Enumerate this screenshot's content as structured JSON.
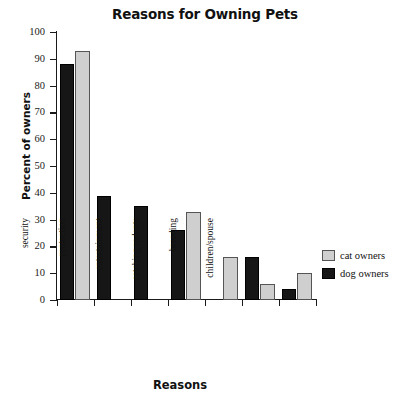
{
  "chart_data": {
    "type": "bar",
    "title": "Reasons for Owning Pets",
    "xlabel": "Reasons",
    "ylabel": "Percent of owners",
    "ylim": [
      0,
      100
    ],
    "ytick_step": 10,
    "yticks": [
      0,
      10,
      20,
      30,
      40,
      50,
      60,
      70,
      80,
      90,
      100
    ],
    "grid": false,
    "legend_position": "right",
    "categories": [
      "love/comp.",
      "security",
      "protection",
      "entertainment",
      "catching rodents",
      "breeding",
      "children/spouse"
    ],
    "series": [
      {
        "name": "dog owners",
        "color": "#161616",
        "values": [
          88,
          39,
          35,
          26,
          0,
          16,
          4
        ]
      },
      {
        "name": "cat owners",
        "color": "#cfcfcf",
        "values": [
          93,
          0,
          0,
          33,
          16,
          6,
          10
        ]
      }
    ]
  },
  "legend": {
    "items": [
      {
        "label": "cat owners",
        "swatch": "cat"
      },
      {
        "label": "dog owners",
        "swatch": "dog"
      }
    ]
  }
}
